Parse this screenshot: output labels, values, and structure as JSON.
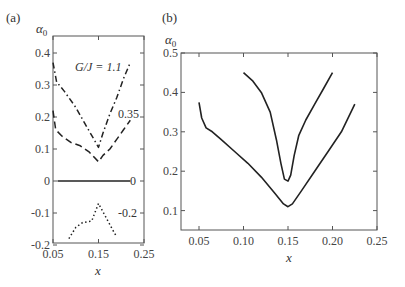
{
  "chart_data": [
    {
      "panel": "(a)",
      "type": "line",
      "title": "",
      "xlabel": "x",
      "ylabel": "α0",
      "xlim": [
        0.05,
        0.25
      ],
      "ylim": [
        -0.2,
        0.45
      ],
      "xticks": [
        "0.05",
        "0.15",
        "0.25"
      ],
      "yticks": [
        "0.4",
        "0.3",
        "0.2",
        "0.1",
        "0",
        "-0.1",
        "-0.2"
      ],
      "right_annotations": [
        "0.35",
        "0",
        "-0.2"
      ],
      "annotation": "G/J = 1.1",
      "grid": false,
      "series": [
        {
          "name": "G/J = 1.1",
          "style": "dashdot",
          "x": [
            0.05,
            0.058,
            0.075,
            0.1,
            0.12,
            0.14,
            0.15,
            0.16,
            0.175,
            0.19,
            0.205,
            0.22
          ],
          "y": [
            0.37,
            0.31,
            0.28,
            0.23,
            0.18,
            0.13,
            0.105,
            0.15,
            0.21,
            0.26,
            0.32,
            0.37
          ]
        },
        {
          "name": "0.35",
          "style": "dashed",
          "x": [
            0.05,
            0.056,
            0.07,
            0.09,
            0.11,
            0.13,
            0.15,
            0.16,
            0.175,
            0.19,
            0.205,
            0.22
          ],
          "y": [
            0.22,
            0.16,
            0.14,
            0.12,
            0.11,
            0.09,
            0.06,
            0.08,
            0.1,
            0.13,
            0.16,
            0.19
          ]
        },
        {
          "name": "0",
          "style": "solid",
          "x": [
            0.06,
            0.22
          ],
          "y": [
            0.0,
            0.0
          ]
        },
        {
          "name": "-0.2",
          "style": "dotted",
          "x": [
            0.085,
            0.1,
            0.115,
            0.135,
            0.15,
            0.165,
            0.18,
            0.19
          ],
          "y": [
            -0.18,
            -0.145,
            -0.13,
            -0.125,
            -0.07,
            -0.11,
            -0.15,
            -0.175
          ]
        }
      ]
    },
    {
      "panel": "(b)",
      "type": "line",
      "title": "",
      "xlabel": "x",
      "ylabel": "α0",
      "xlim": [
        0.03,
        0.25
      ],
      "ylim": [
        0.05,
        0.5
      ],
      "xticks": [
        "0.05",
        "0.10",
        "0.15",
        "0.20",
        "0.25"
      ],
      "yticks": [
        "0.5",
        "0.4",
        "0.3",
        "0.2",
        "0.1"
      ],
      "grid": false,
      "series": [
        {
          "name": "outer curve",
          "style": "solid",
          "x": [
            0.05,
            0.053,
            0.058,
            0.065,
            0.075,
            0.09,
            0.105,
            0.12,
            0.135,
            0.145,
            0.15,
            0.155,
            0.165,
            0.18,
            0.195,
            0.21,
            0.225
          ],
          "y": [
            0.375,
            0.335,
            0.31,
            0.3,
            0.28,
            0.25,
            0.22,
            0.185,
            0.145,
            0.117,
            0.11,
            0.117,
            0.15,
            0.2,
            0.25,
            0.3,
            0.37
          ]
        },
        {
          "name": "inner curve",
          "style": "solid",
          "x": [
            0.1,
            0.11,
            0.12,
            0.13,
            0.137,
            0.142,
            0.146,
            0.15,
            0.153,
            0.157,
            0.162,
            0.17,
            0.18,
            0.19,
            0.2
          ],
          "y": [
            0.45,
            0.43,
            0.4,
            0.35,
            0.28,
            0.22,
            0.18,
            0.175,
            0.19,
            0.24,
            0.29,
            0.33,
            0.37,
            0.41,
            0.45
          ]
        }
      ]
    }
  ],
  "labels": {
    "panel_a": "(a)",
    "panel_b": "(b)",
    "ylabel_a": "α",
    "ylabel_a_sub": "0",
    "ylabel_b": "α",
    "ylabel_b_sub": "0",
    "xlabel_a": "x",
    "xlabel_b": "x",
    "annotation_a": "G/J = 1.1",
    "right_0_35": "0.35",
    "right_0": "0",
    "right_neg_0_2": "-0.2"
  },
  "colors": {
    "line": "#222222",
    "axis": "#555555",
    "background": "#ffffff"
  }
}
